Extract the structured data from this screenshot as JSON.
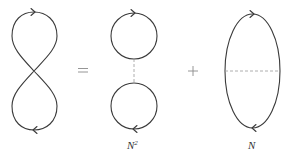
{
  "diagram": {
    "operators": {
      "equals": "=",
      "plus": "+"
    },
    "terms": [
      {
        "id": "figure-eight",
        "shape": "figure-eight loop",
        "arrows": [
          "top: right",
          "bottom: left"
        ],
        "label": ""
      },
      {
        "id": "two-circles",
        "shape": "two circles connected by vertical dashed line",
        "arrows": [
          "top circle: right",
          "bottom circle: left"
        ],
        "label_base": "N",
        "label_sup": "2"
      },
      {
        "id": "ellipse",
        "shape": "vertical ellipse with horizontal dashed chord",
        "arrows": [
          "top: right",
          "bottom: left"
        ],
        "label_base": "N",
        "label_sup": ""
      }
    ],
    "colors": {
      "line": "#3a3a3a",
      "dashed": "#9a9a9a",
      "operator": "#8a8a8a",
      "background": "#ffffff"
    }
  }
}
